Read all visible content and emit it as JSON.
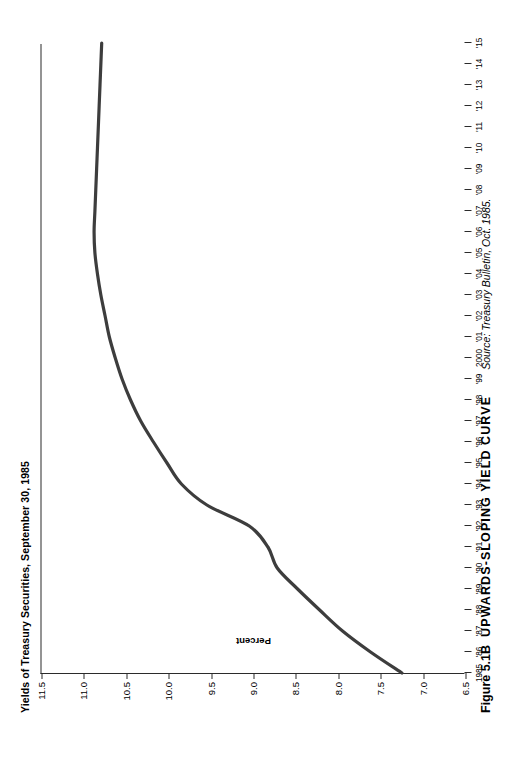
{
  "figure": {
    "title": "Yields of Treasury Securities, September 30, 1985",
    "caption_number": "Figure 5.1B",
    "caption_title": "UPWARDS-SLOPING YIELD CURVE",
    "source": "Source: Treasury Bulletin, Oct. 1985."
  },
  "chart_data": {
    "type": "line",
    "title": "Yields of Treasury Securities, September 30, 1985",
    "xlabel": "",
    "ylabel": "Percent",
    "grid": false,
    "legend": null,
    "line_color": "#3d3d3d",
    "axis_color": "#2b2b2b",
    "xlim": [
      1985,
      2015
    ],
    "ylim": [
      6.5,
      11.5
    ],
    "yticks": [
      11.5,
      11.0,
      10.5,
      10.0,
      9.5,
      9.0,
      8.5,
      8.0,
      7.5,
      7.0,
      6.5
    ],
    "ytick_labels": [
      "11.5",
      "11.0",
      "10.5",
      "10.0",
      "9.5",
      "9.0",
      "8.5",
      "8.0",
      "7.5",
      "7.0",
      "6.5"
    ],
    "xticks": [
      1985,
      1986,
      1987,
      1988,
      1989,
      1990,
      1991,
      1992,
      1993,
      1994,
      1995,
      1996,
      1997,
      1998,
      1999,
      2000,
      2001,
      2002,
      2003,
      2004,
      2005,
      2006,
      2007,
      2008,
      2009,
      2010,
      2011,
      2012,
      2013,
      2014,
      2015
    ],
    "xtick_labels": [
      "1985",
      "'86",
      "'87",
      "'88",
      "'89",
      "'90",
      "'91",
      "'92",
      "'93",
      "'94",
      "'95",
      "'96",
      "'97",
      "'98",
      "'99",
      "2000",
      "'01",
      "'02",
      "'03",
      "'04",
      "'05",
      "'06",
      "'07",
      "'08",
      "'09",
      "'10",
      "'11",
      "'12",
      "'13",
      "'14",
      "'15"
    ],
    "x": [
      1985,
      1986,
      1987,
      1988,
      1989,
      1990,
      1991,
      1992,
      1993,
      1994,
      1995,
      1996,
      1997,
      1998,
      1999,
      2000,
      2001,
      2002,
      2003,
      2004,
      2005,
      2006,
      2007,
      2008,
      2009,
      2010,
      2011,
      2012,
      2013,
      2014,
      2015
    ],
    "values": [
      7.25,
      7.62,
      7.95,
      8.22,
      8.48,
      8.72,
      8.83,
      9.05,
      9.55,
      9.85,
      10.02,
      10.18,
      10.33,
      10.45,
      10.55,
      10.63,
      10.7,
      10.75,
      10.8,
      10.84,
      10.87,
      10.88,
      10.87,
      10.86,
      10.85,
      10.84,
      10.83,
      10.82,
      10.81,
      10.8,
      10.79
    ],
    "series": [
      {
        "name": "Treasury yield curve",
        "values": [
          7.25,
          7.62,
          7.95,
          8.22,
          8.48,
          8.72,
          8.83,
          9.05,
          9.55,
          9.85,
          10.02,
          10.18,
          10.33,
          10.45,
          10.55,
          10.63,
          10.7,
          10.75,
          10.8,
          10.84,
          10.87,
          10.88,
          10.87,
          10.86,
          10.85,
          10.84,
          10.83,
          10.82,
          10.81,
          10.8,
          10.79
        ]
      }
    ]
  }
}
